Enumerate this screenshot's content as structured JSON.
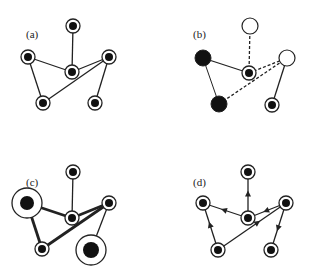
{
  "colors": {
    "stroke": "#222222",
    "fill": "#111111",
    "background": "#ffffff"
  },
  "panels": [
    {
      "id": "a",
      "label": "(a)",
      "label_pos": [
        26,
        38
      ],
      "nodes": [
        {
          "id": "top",
          "x": 73,
          "y": 26,
          "type": "target",
          "r": 7,
          "ri": 4
        },
        {
          "id": "left",
          "x": 28,
          "y": 57,
          "type": "target",
          "r": 7,
          "ri": 4
        },
        {
          "id": "center",
          "x": 72,
          "y": 72,
          "type": "target",
          "r": 7,
          "ri": 4
        },
        {
          "id": "right",
          "x": 109,
          "y": 57,
          "type": "target",
          "r": 7,
          "ri": 4
        },
        {
          "id": "bottom-left",
          "x": 43,
          "y": 103,
          "type": "target",
          "r": 7,
          "ri": 4
        },
        {
          "id": "bottom-right",
          "x": 95,
          "y": 103,
          "type": "target",
          "r": 7,
          "ri": 4
        }
      ],
      "edges": [
        {
          "from": "top",
          "to": "center",
          "style": "solid"
        },
        {
          "from": "left",
          "to": "center",
          "style": "solid"
        },
        {
          "from": "left",
          "to": "bottom-left",
          "style": "solid"
        },
        {
          "from": "center",
          "to": "right",
          "style": "solid"
        },
        {
          "from": "bottom-left",
          "to": "right",
          "style": "solid"
        },
        {
          "from": "right",
          "to": "bottom-right",
          "style": "solid"
        }
      ]
    },
    {
      "id": "b",
      "label": "(b)",
      "label_pos": [
        193,
        38
      ],
      "nodes": [
        {
          "id": "top",
          "x": 250,
          "y": 26,
          "type": "hollow",
          "r": 8
        },
        {
          "id": "left",
          "x": 203,
          "y": 58,
          "type": "filled",
          "r": 8
        },
        {
          "id": "center",
          "x": 249,
          "y": 73,
          "type": "target",
          "r": 7,
          "ri": 4
        },
        {
          "id": "right",
          "x": 287,
          "y": 58,
          "type": "hollow",
          "r": 8
        },
        {
          "id": "bottom-left",
          "x": 219,
          "y": 104,
          "type": "filled",
          "r": 8
        },
        {
          "id": "bottom-right",
          "x": 272,
          "y": 105,
          "type": "target",
          "r": 7,
          "ri": 4
        }
      ],
      "edges": [
        {
          "from": "top",
          "to": "center",
          "style": "dashed"
        },
        {
          "from": "left",
          "to": "center",
          "style": "solid"
        },
        {
          "from": "left",
          "to": "bottom-left",
          "style": "solid-thin"
        },
        {
          "from": "center",
          "to": "right",
          "style": "dashed"
        },
        {
          "from": "bottom-left",
          "to": "right",
          "style": "dashed"
        },
        {
          "from": "right",
          "to": "bottom-right",
          "style": "solid"
        }
      ]
    },
    {
      "id": "c",
      "label": "(c)",
      "label_pos": [
        26,
        186
      ],
      "nodes": [
        {
          "id": "top",
          "x": 73,
          "y": 172,
          "type": "target",
          "r": 7,
          "ri": 4
        },
        {
          "id": "left",
          "x": 27,
          "y": 203,
          "type": "target",
          "r": 15,
          "ri": 7
        },
        {
          "id": "center",
          "x": 72,
          "y": 218,
          "type": "target",
          "r": 7,
          "ri": 4
        },
        {
          "id": "right",
          "x": 109,
          "y": 203,
          "type": "target",
          "r": 7,
          "ri": 4
        },
        {
          "id": "bottom-left",
          "x": 42,
          "y": 249,
          "type": "target",
          "r": 7,
          "ri": 4
        },
        {
          "id": "bottom-right",
          "x": 91,
          "y": 250,
          "type": "target",
          "r": 15,
          "ri": 8
        }
      ],
      "edges": [
        {
          "from": "top",
          "to": "center",
          "style": "solid"
        },
        {
          "from": "left",
          "to": "center",
          "style": "thick"
        },
        {
          "from": "left",
          "to": "bottom-left",
          "style": "thick"
        },
        {
          "from": "center",
          "to": "right",
          "style": "thick"
        },
        {
          "from": "bottom-left",
          "to": "right",
          "style": "thick"
        },
        {
          "from": "right",
          "to": "bottom-right",
          "style": "solid"
        }
      ]
    },
    {
      "id": "d",
      "label": "(d)",
      "label_pos": [
        193,
        186
      ],
      "nodes": [
        {
          "id": "top",
          "x": 248,
          "y": 172,
          "type": "target",
          "r": 7,
          "ri": 4
        },
        {
          "id": "left",
          "x": 203,
          "y": 203,
          "type": "target",
          "r": 7,
          "ri": 4
        },
        {
          "id": "center",
          "x": 248,
          "y": 218,
          "type": "target",
          "r": 7,
          "ri": 4
        },
        {
          "id": "right",
          "x": 286,
          "y": 203,
          "type": "target",
          "r": 7,
          "ri": 4
        },
        {
          "id": "bottom-left",
          "x": 218,
          "y": 250,
          "type": "target",
          "r": 7,
          "ri": 4
        },
        {
          "id": "bottom-right",
          "x": 271,
          "y": 250,
          "type": "target",
          "r": 7,
          "ri": 4
        }
      ],
      "edges": [
        {
          "from": "center",
          "to": "top",
          "style": "arrow"
        },
        {
          "from": "center",
          "to": "left",
          "style": "arrow"
        },
        {
          "from": "right",
          "to": "center",
          "style": "arrow"
        },
        {
          "from": "bottom-left",
          "to": "left",
          "style": "arrow"
        },
        {
          "from": "bottom-left",
          "to": "right",
          "style": "arrow-mid"
        },
        {
          "from": "right",
          "to": "bottom-right",
          "style": "arrow"
        }
      ]
    }
  ]
}
